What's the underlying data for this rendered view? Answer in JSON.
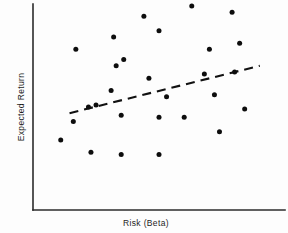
{
  "chart_data": {
    "type": "scatter",
    "title": "",
    "xlabel": "Risk (Beta)",
    "ylabel": "Expected Return",
    "grid": false,
    "legend": null,
    "xlim": [
      0,
      1
    ],
    "ylim": [
      0,
      1
    ],
    "axis_ticks": {
      "x": [],
      "y": []
    },
    "points": [
      {
        "x": 0.17,
        "y": 0.78
      },
      {
        "x": 0.32,
        "y": 0.84
      },
      {
        "x": 0.33,
        "y": 0.7
      },
      {
        "x": 0.25,
        "y": 0.51
      },
      {
        "x": 0.44,
        "y": 0.94
      },
      {
        "x": 0.5,
        "y": 0.87
      },
      {
        "x": 0.63,
        "y": 0.99
      },
      {
        "x": 0.79,
        "y": 0.96
      },
      {
        "x": 0.82,
        "y": 0.81
      },
      {
        "x": 0.7,
        "y": 0.78
      },
      {
        "x": 0.36,
        "y": 0.73
      },
      {
        "x": 0.31,
        "y": 0.58
      },
      {
        "x": 0.46,
        "y": 0.64
      },
      {
        "x": 0.22,
        "y": 0.5
      },
      {
        "x": 0.8,
        "y": 0.67
      },
      {
        "x": 0.68,
        "y": 0.66
      },
      {
        "x": 0.53,
        "y": 0.55
      },
      {
        "x": 0.35,
        "y": 0.46
      },
      {
        "x": 0.16,
        "y": 0.43
      },
      {
        "x": 0.72,
        "y": 0.56
      },
      {
        "x": 0.84,
        "y": 0.49
      },
      {
        "x": 0.5,
        "y": 0.45
      },
      {
        "x": 0.6,
        "y": 0.45
      },
      {
        "x": 0.11,
        "y": 0.34
      },
      {
        "x": 0.23,
        "y": 0.28
      },
      {
        "x": 0.35,
        "y": 0.27
      },
      {
        "x": 0.5,
        "y": 0.27
      },
      {
        "x": 0.74,
        "y": 0.38
      }
    ],
    "trend_line": {
      "style": "dashed",
      "x_start": 0.145,
      "y_start": 0.47,
      "x_end": 0.9,
      "y_end": 0.7
    },
    "colors": {
      "point": "#0d0d0d",
      "axis": "#2b2b2b",
      "trend": "#111111",
      "background": "#fdfdfd"
    }
  }
}
